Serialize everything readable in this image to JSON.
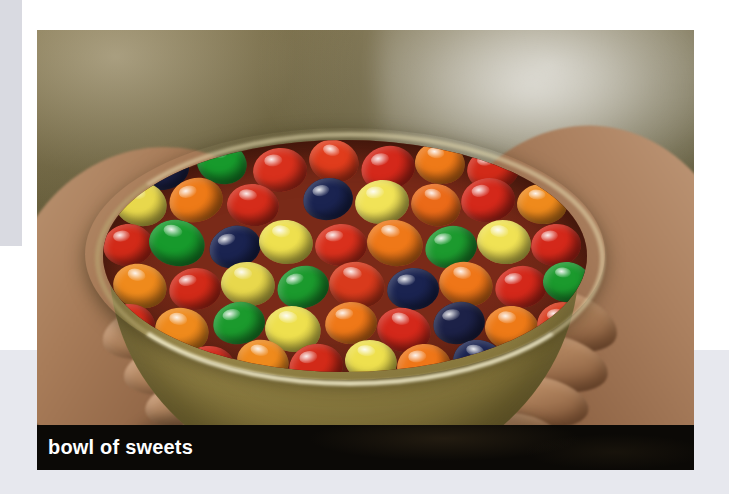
{
  "page": {
    "background_color": "#ffffff",
    "left_band_color": "#d9dae1",
    "bottom_band_color": "#e7e8ee"
  },
  "photo": {
    "alt": "bowl of sweets",
    "subject": "two hands holding a ceramic bowl filled with multicolored jelly beans",
    "frame": {
      "x": 37,
      "y": 30,
      "width": 657,
      "height": 440
    },
    "palette": {
      "backdrop": "#5c5534",
      "skin": "#a87c59",
      "bowl": "#a39152",
      "bean_red": "#d42a1a",
      "bean_orange": "#f07818",
      "bean_yellow": "#efe052",
      "bean_green": "#2a9930",
      "bean_navy": "#1d2450"
    }
  },
  "caption": {
    "text": "bowl of sweets",
    "background_color": "#0b0906",
    "text_color": "#ffffff"
  },
  "beans": [
    {
      "x": 34,
      "y": 6,
      "w": 52,
      "h": 44,
      "c": "#1c2147",
      "r": -8
    },
    {
      "x": 94,
      "y": 2,
      "w": 50,
      "h": 42,
      "c": "#179a2c",
      "r": 12
    },
    {
      "x": 150,
      "y": 8,
      "w": 54,
      "h": 44,
      "c": "#d8301c",
      "r": -4
    },
    {
      "x": 206,
      "y": 0,
      "w": 50,
      "h": 42,
      "c": "#e03c1c",
      "r": 16
    },
    {
      "x": 258,
      "y": 6,
      "w": 54,
      "h": 44,
      "c": "#d4281a",
      "r": -12
    },
    {
      "x": 312,
      "y": 2,
      "w": 50,
      "h": 42,
      "c": "#ef7a18",
      "r": 8
    },
    {
      "x": 364,
      "y": 8,
      "w": 52,
      "h": 42,
      "c": "#d22a18",
      "r": -6
    },
    {
      "x": 416,
      "y": 0,
      "w": 48,
      "h": 40,
      "c": "#15224e",
      "r": 18
    },
    {
      "x": 200,
      "y": 38,
      "w": 50,
      "h": 42,
      "c": "#1a2350",
      "r": -10
    },
    {
      "x": 12,
      "y": 42,
      "w": 52,
      "h": 44,
      "c": "#e8d84c",
      "r": 10
    },
    {
      "x": 66,
      "y": 38,
      "w": 54,
      "h": 44,
      "c": "#ee7a17",
      "r": -14
    },
    {
      "x": 124,
      "y": 44,
      "w": 52,
      "h": 42,
      "c": "#d52c1a",
      "r": 6
    },
    {
      "x": 252,
      "y": 40,
      "w": 54,
      "h": 44,
      "c": "#f1e357",
      "r": -5
    },
    {
      "x": 308,
      "y": 44,
      "w": 50,
      "h": 42,
      "c": "#eb6a18",
      "r": 14
    },
    {
      "x": 358,
      "y": 38,
      "w": 54,
      "h": 44,
      "c": "#d4281a",
      "r": -8
    },
    {
      "x": 414,
      "y": 44,
      "w": 50,
      "h": 40,
      "c": "#ef8a1c",
      "r": 4
    },
    {
      "x": 0,
      "y": 84,
      "w": 50,
      "h": 42,
      "c": "#d22a18",
      "r": -6
    },
    {
      "x": 46,
      "y": 80,
      "w": 56,
      "h": 46,
      "c": "#179a2c",
      "r": 12
    },
    {
      "x": 106,
      "y": 86,
      "w": 52,
      "h": 42,
      "c": "#1a2350",
      "r": -16
    },
    {
      "x": 156,
      "y": 80,
      "w": 54,
      "h": 44,
      "c": "#eee04e",
      "r": 6
    },
    {
      "x": 212,
      "y": 84,
      "w": 52,
      "h": 42,
      "c": "#d9301c",
      "r": -4
    },
    {
      "x": 264,
      "y": 80,
      "w": 56,
      "h": 46,
      "c": "#ef7818",
      "r": 10
    },
    {
      "x": 322,
      "y": 86,
      "w": 52,
      "h": 42,
      "c": "#1c9a2e",
      "r": -12
    },
    {
      "x": 374,
      "y": 80,
      "w": 54,
      "h": 44,
      "c": "#f0e254",
      "r": 8
    },
    {
      "x": 428,
      "y": 84,
      "w": 50,
      "h": 42,
      "c": "#d4281a",
      "r": -6
    },
    {
      "x": 10,
      "y": 124,
      "w": 54,
      "h": 44,
      "c": "#ef8a1c",
      "r": 14
    },
    {
      "x": 66,
      "y": 128,
      "w": 52,
      "h": 42,
      "c": "#d22a18",
      "r": -8
    },
    {
      "x": 118,
      "y": 122,
      "w": 54,
      "h": 44,
      "c": "#e8d84c",
      "r": 6
    },
    {
      "x": 174,
      "y": 126,
      "w": 52,
      "h": 42,
      "c": "#1b9a2d",
      "r": -14
    },
    {
      "x": 226,
      "y": 122,
      "w": 56,
      "h": 46,
      "c": "#d93a1c",
      "r": 10
    },
    {
      "x": 284,
      "y": 128,
      "w": 52,
      "h": 42,
      "c": "#1a2350",
      "r": -4
    },
    {
      "x": 336,
      "y": 122,
      "w": 54,
      "h": 44,
      "c": "#ef7618",
      "r": 12
    },
    {
      "x": 392,
      "y": 126,
      "w": 52,
      "h": 42,
      "c": "#d4281a",
      "r": -10
    },
    {
      "x": 440,
      "y": 122,
      "w": 48,
      "h": 40,
      "c": "#1b9a2d",
      "r": 6
    },
    {
      "x": 0,
      "y": 164,
      "w": 52,
      "h": 44,
      "c": "#d52c1a",
      "r": -6
    },
    {
      "x": 52,
      "y": 168,
      "w": 54,
      "h": 44,
      "c": "#ef8a1c",
      "r": 12
    },
    {
      "x": 110,
      "y": 162,
      "w": 52,
      "h": 42,
      "c": "#1b9a2d",
      "r": -10
    },
    {
      "x": 162,
      "y": 166,
      "w": 56,
      "h": 46,
      "c": "#eee04e",
      "r": 8
    },
    {
      "x": 222,
      "y": 162,
      "w": 52,
      "h": 42,
      "c": "#ef7818",
      "r": -4
    },
    {
      "x": 274,
      "y": 168,
      "w": 54,
      "h": 44,
      "c": "#d4281a",
      "r": 14
    },
    {
      "x": 330,
      "y": 162,
      "w": 52,
      "h": 42,
      "c": "#1c2147",
      "r": -12
    },
    {
      "x": 382,
      "y": 166,
      "w": 54,
      "h": 44,
      "c": "#ee7a17",
      "r": 6
    },
    {
      "x": 434,
      "y": 162,
      "w": 50,
      "h": 42,
      "c": "#d93a1c",
      "r": -8
    },
    {
      "x": 24,
      "y": 202,
      "w": 52,
      "h": 42,
      "c": "#1b9a2d",
      "r": 10
    },
    {
      "x": 78,
      "y": 206,
      "w": 54,
      "h": 44,
      "c": "#d4281a",
      "r": -6
    },
    {
      "x": 134,
      "y": 200,
      "w": 52,
      "h": 42,
      "c": "#ef8a1c",
      "r": 14
    },
    {
      "x": 186,
      "y": 204,
      "w": 54,
      "h": 44,
      "c": "#d22a18",
      "r": -10
    },
    {
      "x": 242,
      "y": 200,
      "w": 52,
      "h": 42,
      "c": "#eee04e",
      "r": 8
    },
    {
      "x": 294,
      "y": 204,
      "w": 54,
      "h": 44,
      "c": "#ef7618",
      "r": -4
    },
    {
      "x": 350,
      "y": 200,
      "w": 52,
      "h": 42,
      "c": "#1a2350",
      "r": 12
    },
    {
      "x": 402,
      "y": 204,
      "w": 50,
      "h": 42,
      "c": "#d4281a",
      "r": -8
    },
    {
      "x": 60,
      "y": 240,
      "w": 52,
      "h": 42,
      "c": "#d93a1c",
      "r": 6
    },
    {
      "x": 114,
      "y": 244,
      "w": 54,
      "h": 42,
      "c": "#1b9a2d",
      "r": -12
    },
    {
      "x": 170,
      "y": 238,
      "w": 52,
      "h": 42,
      "c": "#ef8a1c",
      "r": 10
    },
    {
      "x": 222,
      "y": 242,
      "w": 54,
      "h": 42,
      "c": "#d4281a",
      "r": -6
    },
    {
      "x": 278,
      "y": 238,
      "w": 52,
      "h": 42,
      "c": "#eee04e",
      "r": 14
    },
    {
      "x": 330,
      "y": 242,
      "w": 52,
      "h": 42,
      "c": "#ef7618",
      "r": -10
    },
    {
      "x": 382,
      "y": 238,
      "w": 50,
      "h": 40,
      "c": "#1c2147",
      "r": 8
    },
    {
      "x": 120,
      "y": 272,
      "w": 50,
      "h": 40,
      "c": "#d4281a",
      "r": -6
    },
    {
      "x": 172,
      "y": 274,
      "w": 52,
      "h": 40,
      "c": "#1a2350",
      "r": 10
    },
    {
      "x": 226,
      "y": 272,
      "w": 50,
      "h": 40,
      "c": "#ef7818",
      "r": -8
    },
    {
      "x": 278,
      "y": 274,
      "w": 52,
      "h": 40,
      "c": "#d93a1c",
      "r": 6
    },
    {
      "x": 330,
      "y": 272,
      "w": 48,
      "h": 38,
      "c": "#1b9a2d",
      "r": -12
    }
  ]
}
